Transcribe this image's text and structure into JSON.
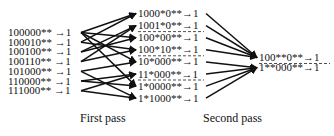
{
  "diagram": {
    "colors": {
      "ink": "#111111",
      "background": "#ffffff"
    },
    "columns": {
      "input": [
        "100000** →1",
        "100010** →1",
        "100100** →1",
        "100110** →1",
        "101000** →1",
        "110000** →1",
        "111000** →1"
      ],
      "first_pass": [
        "1000*0**→1",
        "1001*0**→1",
        "100*00**→1",
        "100*10**→1",
        "10*000**→1",
        "11*000**→1",
        "1*0000**→1",
        "1*1000**→1"
      ],
      "second_pass": [
        "100**0**→1",
        "1**000**→1"
      ]
    },
    "first_pass_edges": [
      [
        0,
        0
      ],
      [
        1,
        0
      ],
      [
        2,
        1
      ],
      [
        3,
        1
      ],
      [
        0,
        2
      ],
      [
        2,
        2
      ],
      [
        1,
        3
      ],
      [
        3,
        3
      ],
      [
        0,
        4
      ],
      [
        4,
        4
      ],
      [
        5,
        5
      ],
      [
        6,
        5
      ],
      [
        0,
        6
      ],
      [
        5,
        6
      ],
      [
        4,
        7
      ],
      [
        6,
        7
      ]
    ],
    "second_pass_edges": [
      [
        0,
        0
      ],
      [
        1,
        0
      ],
      [
        2,
        0
      ],
      [
        3,
        0
      ],
      [
        4,
        1
      ],
      [
        5,
        1
      ],
      [
        6,
        1
      ],
      [
        7,
        1
      ]
    ],
    "group_separators_after": [
      1,
      3,
      5
    ],
    "labels": {
      "first_pass": "First pass",
      "second_pass": "Second pass"
    }
  }
}
